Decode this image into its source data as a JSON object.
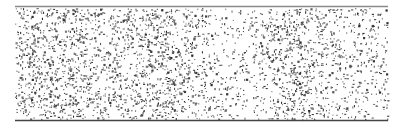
{
  "chart_data": {
    "type": "scatter",
    "title": "",
    "xlabel": "",
    "ylabel": "",
    "grid": false,
    "legend": null,
    "plot_area": {
      "x0": 15,
      "x1": 388,
      "y0": 7,
      "y1": 120
    },
    "top_rule": {
      "y": 6.5,
      "color": "#8a8a8a",
      "width": 1.6
    },
    "bottom_rule": {
      "y": 120.5,
      "color": "#444444",
      "width": 1.4
    },
    "dot_color": "#333333",
    "dot_size": 1.1,
    "density_profile": [
      {
        "x": 15,
        "density": 0.55
      },
      {
        "x": 40,
        "density": 0.75
      },
      {
        "x": 70,
        "density": 0.7
      },
      {
        "x": 100,
        "density": 0.55
      },
      {
        "x": 130,
        "density": 0.7
      },
      {
        "x": 160,
        "density": 0.8
      },
      {
        "x": 190,
        "density": 0.65
      },
      {
        "x": 215,
        "density": 0.35
      },
      {
        "x": 240,
        "density": 0.25
      },
      {
        "x": 262,
        "density": 0.4
      },
      {
        "x": 285,
        "density": 0.8
      },
      {
        "x": 305,
        "density": 0.75
      },
      {
        "x": 330,
        "density": 0.45
      },
      {
        "x": 350,
        "density": 0.3
      },
      {
        "x": 370,
        "density": 0.4
      },
      {
        "x": 388,
        "density": 0.35
      }
    ],
    "total_points_estimate": 3200,
    "seed": 1337
  }
}
